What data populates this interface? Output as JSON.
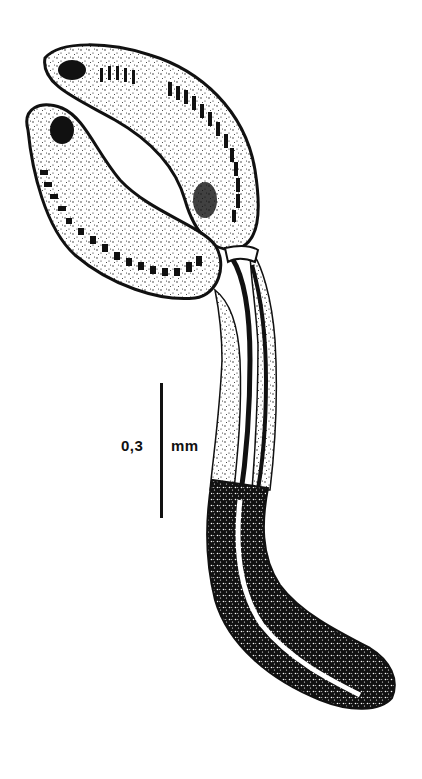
{
  "figure": {
    "style": "black ink stipple illustration on white",
    "colors": {
      "ink": "#111111",
      "background": "#ffffff"
    }
  },
  "scale_bar": {
    "value": "0,3",
    "unit": "mm"
  }
}
